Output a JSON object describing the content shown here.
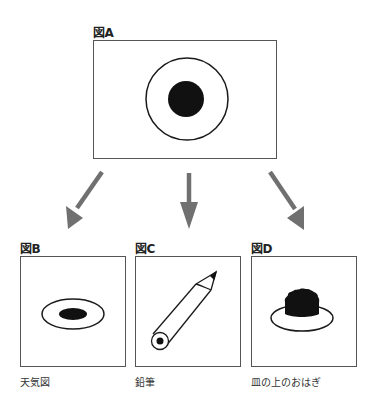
{
  "figures": [
    {
      "id": "A",
      "label": "図A",
      "caption": "",
      "depicts": "concentric circle: ring with filled center dot"
    },
    {
      "id": "B",
      "label": "図B",
      "caption": "天気図",
      "depicts": "flattened ring with filled oval (perspective view)"
    },
    {
      "id": "C",
      "label": "図C",
      "caption": "鉛筆",
      "depicts": "pencil seen diagonally with end circle"
    },
    {
      "id": "D",
      "label": "図D",
      "caption": "皿の上のおはぎ",
      "depicts": "ohagi on a plate"
    }
  ],
  "arrows": [
    {
      "from": "A",
      "to": "B",
      "direction": "down-left"
    },
    {
      "from": "A",
      "to": "C",
      "direction": "down"
    },
    {
      "from": "A",
      "to": "D",
      "direction": "down-right"
    }
  ],
  "colors": {
    "stroke": "#1a1a1a",
    "fill": "#111111",
    "arrow": "#707070",
    "border": "#555555"
  }
}
